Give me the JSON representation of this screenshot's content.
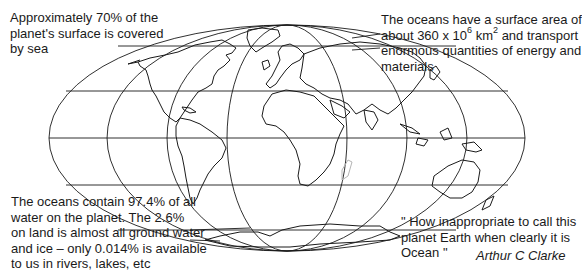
{
  "diagram": {
    "map": {
      "projection": "elliptical (Mollweide-style) world outline",
      "line_color": "#1a1a1a",
      "highlight_color": "#b5b5b5",
      "parallels": 5,
      "meridians": 9
    },
    "notes": {
      "top_left": {
        "lines": [
          "Approximately 70% of the",
          "planet's surface is covered",
          "by sea"
        ]
      },
      "top_right": {
        "line1": "The oceans have a surface area of",
        "line2_pre": "about 360 x 10",
        "line2_sup1": "6",
        "line2_mid": " km",
        "line2_sup2": "2",
        "line2_post": " and transport",
        "line3": "enormous quantities of energy and",
        "line4": "materials"
      },
      "bottom_left": {
        "lines": [
          "The oceans contain 97.4% of all",
          "water on the planet. The 2.6%",
          "on land is almost all ground water",
          "and ice – only 0.014% is available",
          "to us in rivers, lakes, etc"
        ]
      },
      "bottom_right": {
        "lines": [
          "\" How inappropriate to call this",
          "planet Earth when clearly it is",
          "Ocean \""
        ]
      }
    },
    "credit": "Arthur C Clarke"
  }
}
